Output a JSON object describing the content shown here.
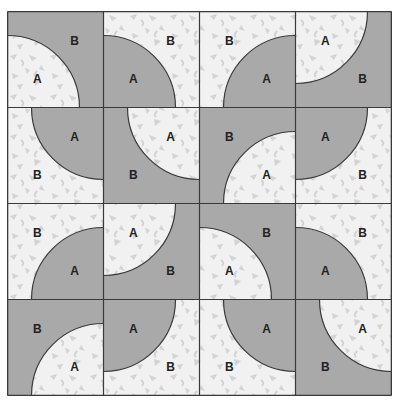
{
  "diagram": {
    "grid": {
      "rows": 4,
      "cols": 4,
      "tile_size": 96
    },
    "colors": {
      "dark": "#a9a9a9",
      "light": "#f1f1f1",
      "confetti": "#d3d3d3",
      "line": "#3a3a3a",
      "label": "#222222"
    },
    "arc_radius_ratio": 0.75,
    "labels": {
      "quarter": "A",
      "rest": "B"
    },
    "tiles": [
      [
        {
          "corner": "BL",
          "quarter": "light"
        },
        {
          "corner": "BL",
          "quarter": "dark"
        },
        {
          "corner": "BR",
          "quarter": "dark"
        },
        {
          "corner": "TL",
          "quarter": "light"
        }
      ],
      [
        {
          "corner": "TR",
          "quarter": "dark"
        },
        {
          "corner": "TR",
          "quarter": "light"
        },
        {
          "corner": "BR",
          "quarter": "light"
        },
        {
          "corner": "TL",
          "quarter": "dark"
        }
      ],
      [
        {
          "corner": "BR",
          "quarter": "dark"
        },
        {
          "corner": "TL",
          "quarter": "light"
        },
        {
          "corner": "BL",
          "quarter": "light"
        },
        {
          "corner": "BL",
          "quarter": "dark"
        }
      ],
      [
        {
          "corner": "BR",
          "quarter": "light"
        },
        {
          "corner": "TL",
          "quarter": "dark"
        },
        {
          "corner": "TR",
          "quarter": "dark"
        },
        {
          "corner": "TR",
          "quarter": "light"
        }
      ]
    ]
  }
}
